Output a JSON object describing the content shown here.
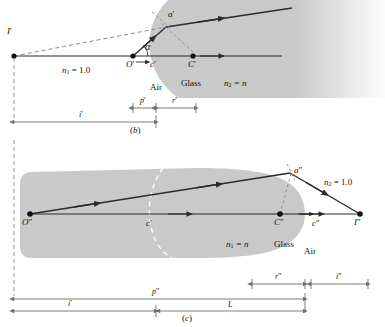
{
  "figure": {
    "panels": [
      {
        "id": "b",
        "caption": "(b)",
        "media": {
          "left_index_label": "n",
          "left_index_sub": "1",
          "left_index_value": "= 1.0",
          "left_medium": "Air",
          "right_index_label": "n",
          "right_index_sub": "2",
          "right_index_value": "= n",
          "right_medium": "Glass"
        },
        "points": [
          {
            "name": "I-prime",
            "label": "I",
            "prime": "′"
          },
          {
            "name": "O-prime",
            "label": "O",
            "prime": "′"
          },
          {
            "name": "C-prime",
            "label": "C",
            "prime": "′"
          },
          {
            "name": "a-prime",
            "label": "a",
            "prime": "′"
          },
          {
            "name": "c-prime",
            "label": "c",
            "prime": "′"
          }
        ],
        "angle_label": "α",
        "dimensions": [
          {
            "name": "object-distance",
            "label": "p",
            "prime": "′"
          },
          {
            "name": "radius",
            "label": "r",
            "prime": "′"
          },
          {
            "name": "image-distance",
            "label": "i",
            "prime": "′"
          }
        ]
      },
      {
        "id": "c",
        "caption": "(c)",
        "media": {
          "left_index_label": "n",
          "left_index_sub": "1",
          "left_index_value": "= n",
          "left_medium": "Glass",
          "right_index_label": "n",
          "right_index_sub": "2",
          "right_index_value": "= 1.0",
          "right_medium": "Air"
        },
        "points": [
          {
            "name": "O-double-prime",
            "label": "O",
            "prime": "″"
          },
          {
            "name": "C-double-prime",
            "label": "C",
            "prime": "″"
          },
          {
            "name": "I-double-prime",
            "label": "I",
            "prime": "″"
          },
          {
            "name": "a-double-prime",
            "label": "a",
            "prime": "″"
          },
          {
            "name": "c-prime",
            "label": "c",
            "prime": "′"
          },
          {
            "name": "c-double-prime",
            "label": "c",
            "prime": "″"
          }
        ],
        "dimensions": [
          {
            "name": "radius-2",
            "label": "r",
            "prime": "″"
          },
          {
            "name": "image-distance-2",
            "label": "i",
            "prime": "″"
          },
          {
            "name": "object-distance-2",
            "label": "p",
            "prime": "″"
          },
          {
            "name": "image-distance-1",
            "label": "i",
            "prime": "′"
          },
          {
            "name": "thickness",
            "label": "L",
            "prime": ""
          }
        ]
      }
    ],
    "colors": {
      "glass_fill": "#c9c9c9",
      "glass_fill_soft": "#d2d2d2",
      "ray": "#2b2b2b",
      "dashed": "#8a8a8a",
      "dimension": "#6f6f6f",
      "text": "#111111",
      "background": "#ffffff"
    }
  }
}
